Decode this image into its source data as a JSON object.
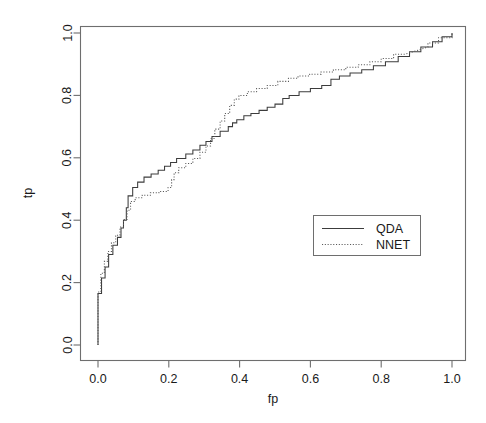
{
  "chart_data": {
    "type": "line",
    "title": "",
    "xlabel": "fp",
    "ylabel": "tp",
    "xlim": [
      0.0,
      1.0
    ],
    "ylim": [
      0.0,
      1.0
    ],
    "grid": false,
    "legend_position": "center-right",
    "xticks": [
      "0.0",
      "0.2",
      "0.4",
      "0.6",
      "0.8",
      "1.0"
    ],
    "xtick_values": [
      0.0,
      0.2,
      0.4,
      0.6,
      0.8,
      1.0
    ],
    "yticks": [
      "0.0",
      "0.2",
      "0.4",
      "0.6",
      "0.8",
      "1.0"
    ],
    "ytick_values": [
      0.0,
      0.2,
      0.4,
      0.6,
      0.8,
      1.0
    ],
    "legend": [
      {
        "name": "QDA",
        "style": "solid"
      },
      {
        "name": "NNET",
        "style": "dotted"
      }
    ],
    "series": [
      {
        "name": "QDA",
        "style": "solid",
        "points": [
          [
            0.0,
            0.0
          ],
          [
            0.0,
            0.165
          ],
          [
            0.01,
            0.165
          ],
          [
            0.01,
            0.215
          ],
          [
            0.02,
            0.215
          ],
          [
            0.02,
            0.25
          ],
          [
            0.03,
            0.25
          ],
          [
            0.03,
            0.29
          ],
          [
            0.042,
            0.29
          ],
          [
            0.042,
            0.32
          ],
          [
            0.055,
            0.32
          ],
          [
            0.055,
            0.345
          ],
          [
            0.065,
            0.345
          ],
          [
            0.065,
            0.375
          ],
          [
            0.072,
            0.375
          ],
          [
            0.072,
            0.4
          ],
          [
            0.08,
            0.4
          ],
          [
            0.08,
            0.44
          ],
          [
            0.085,
            0.44
          ],
          [
            0.085,
            0.478
          ],
          [
            0.098,
            0.478
          ],
          [
            0.098,
            0.505
          ],
          [
            0.112,
            0.505
          ],
          [
            0.112,
            0.522
          ],
          [
            0.13,
            0.522
          ],
          [
            0.13,
            0.538
          ],
          [
            0.15,
            0.538
          ],
          [
            0.15,
            0.548
          ],
          [
            0.17,
            0.548
          ],
          [
            0.17,
            0.56
          ],
          [
            0.188,
            0.56
          ],
          [
            0.188,
            0.573
          ],
          [
            0.205,
            0.573
          ],
          [
            0.205,
            0.585
          ],
          [
            0.222,
            0.585
          ],
          [
            0.222,
            0.598
          ],
          [
            0.248,
            0.598
          ],
          [
            0.248,
            0.612
          ],
          [
            0.268,
            0.612
          ],
          [
            0.268,
            0.625
          ],
          [
            0.288,
            0.625
          ],
          [
            0.288,
            0.64
          ],
          [
            0.305,
            0.64
          ],
          [
            0.305,
            0.652
          ],
          [
            0.322,
            0.652
          ],
          [
            0.322,
            0.668
          ],
          [
            0.345,
            0.668
          ],
          [
            0.345,
            0.685
          ],
          [
            0.368,
            0.685
          ],
          [
            0.368,
            0.7
          ],
          [
            0.38,
            0.7
          ],
          [
            0.38,
            0.712
          ],
          [
            0.392,
            0.712
          ],
          [
            0.392,
            0.722
          ],
          [
            0.412,
            0.722
          ],
          [
            0.412,
            0.735
          ],
          [
            0.432,
            0.735
          ],
          [
            0.432,
            0.742
          ],
          [
            0.455,
            0.742
          ],
          [
            0.455,
            0.752
          ],
          [
            0.478,
            0.752
          ],
          [
            0.478,
            0.762
          ],
          [
            0.5,
            0.762
          ],
          [
            0.5,
            0.772
          ],
          [
            0.522,
            0.772
          ],
          [
            0.522,
            0.79
          ],
          [
            0.54,
            0.79
          ],
          [
            0.54,
            0.8
          ],
          [
            0.568,
            0.8
          ],
          [
            0.568,
            0.812
          ],
          [
            0.6,
            0.812
          ],
          [
            0.6,
            0.822
          ],
          [
            0.632,
            0.822
          ],
          [
            0.632,
            0.832
          ],
          [
            0.658,
            0.832
          ],
          [
            0.658,
            0.852
          ],
          [
            0.682,
            0.852
          ],
          [
            0.682,
            0.862
          ],
          [
            0.712,
            0.862
          ],
          [
            0.712,
            0.872
          ],
          [
            0.745,
            0.872
          ],
          [
            0.745,
            0.882
          ],
          [
            0.778,
            0.882
          ],
          [
            0.778,
            0.895
          ],
          [
            0.812,
            0.895
          ],
          [
            0.812,
            0.908
          ],
          [
            0.848,
            0.908
          ],
          [
            0.848,
            0.925
          ],
          [
            0.88,
            0.925
          ],
          [
            0.88,
            0.94
          ],
          [
            0.912,
            0.94
          ],
          [
            0.912,
            0.955
          ],
          [
            0.945,
            0.955
          ],
          [
            0.945,
            0.972
          ],
          [
            0.972,
            0.972
          ],
          [
            0.972,
            0.988
          ],
          [
            1.0,
            0.988
          ],
          [
            1.0,
            1.0
          ]
        ]
      },
      {
        "name": "NNET",
        "style": "dotted",
        "points": [
          [
            0.0,
            0.0
          ],
          [
            0.0,
            0.17
          ],
          [
            0.008,
            0.17
          ],
          [
            0.008,
            0.23
          ],
          [
            0.018,
            0.23
          ],
          [
            0.018,
            0.268
          ],
          [
            0.028,
            0.268
          ],
          [
            0.028,
            0.3
          ],
          [
            0.038,
            0.3
          ],
          [
            0.038,
            0.328
          ],
          [
            0.05,
            0.328
          ],
          [
            0.05,
            0.352
          ],
          [
            0.062,
            0.352
          ],
          [
            0.062,
            0.378
          ],
          [
            0.072,
            0.378
          ],
          [
            0.072,
            0.402
          ],
          [
            0.082,
            0.402
          ],
          [
            0.082,
            0.432
          ],
          [
            0.092,
            0.432
          ],
          [
            0.092,
            0.46
          ],
          [
            0.105,
            0.46
          ],
          [
            0.105,
            0.472
          ],
          [
            0.125,
            0.472
          ],
          [
            0.125,
            0.48
          ],
          [
            0.148,
            0.48
          ],
          [
            0.148,
            0.488
          ],
          [
            0.172,
            0.488
          ],
          [
            0.172,
            0.492
          ],
          [
            0.198,
            0.492
          ],
          [
            0.198,
            0.505
          ],
          [
            0.208,
            0.505
          ],
          [
            0.208,
            0.53
          ],
          [
            0.215,
            0.53
          ],
          [
            0.215,
            0.552
          ],
          [
            0.228,
            0.552
          ],
          [
            0.228,
            0.568
          ],
          [
            0.248,
            0.568
          ],
          [
            0.248,
            0.582
          ],
          [
            0.268,
            0.582
          ],
          [
            0.268,
            0.598
          ],
          [
            0.288,
            0.598
          ],
          [
            0.288,
            0.618
          ],
          [
            0.305,
            0.618
          ],
          [
            0.305,
            0.638
          ],
          [
            0.318,
            0.638
          ],
          [
            0.318,
            0.662
          ],
          [
            0.33,
            0.662
          ],
          [
            0.33,
            0.692
          ],
          [
            0.345,
            0.692
          ],
          [
            0.345,
            0.718
          ],
          [
            0.358,
            0.718
          ],
          [
            0.358,
            0.742
          ],
          [
            0.372,
            0.742
          ],
          [
            0.372,
            0.768
          ],
          [
            0.385,
            0.768
          ],
          [
            0.385,
            0.788
          ],
          [
            0.398,
            0.788
          ],
          [
            0.398,
            0.8
          ],
          [
            0.422,
            0.8
          ],
          [
            0.422,
            0.812
          ],
          [
            0.448,
            0.812
          ],
          [
            0.448,
            0.822
          ],
          [
            0.478,
            0.822
          ],
          [
            0.478,
            0.832
          ],
          [
            0.508,
            0.832
          ],
          [
            0.508,
            0.845
          ],
          [
            0.538,
            0.845
          ],
          [
            0.538,
            0.855
          ],
          [
            0.565,
            0.855
          ],
          [
            0.565,
            0.862
          ],
          [
            0.598,
            0.862
          ],
          [
            0.598,
            0.868
          ],
          [
            0.63,
            0.868
          ],
          [
            0.63,
            0.875
          ],
          [
            0.665,
            0.875
          ],
          [
            0.665,
            0.882
          ],
          [
            0.7,
            0.882
          ],
          [
            0.7,
            0.89
          ],
          [
            0.735,
            0.89
          ],
          [
            0.735,
            0.898
          ],
          [
            0.768,
            0.898
          ],
          [
            0.768,
            0.908
          ],
          [
            0.8,
            0.908
          ],
          [
            0.8,
            0.918
          ],
          [
            0.835,
            0.918
          ],
          [
            0.835,
            0.932
          ],
          [
            0.868,
            0.932
          ],
          [
            0.932,
            0.955
          ],
          [
            0.932,
            0.968
          ],
          [
            0.962,
            0.968
          ],
          [
            0.962,
            0.985
          ],
          [
            1.0,
            0.985
          ],
          [
            1.0,
            1.0
          ]
        ]
      }
    ]
  }
}
